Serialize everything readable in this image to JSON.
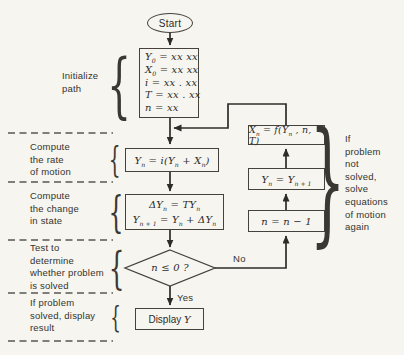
{
  "figure": {
    "kind": "flowchart"
  },
  "terminal": {
    "start": "Start"
  },
  "nodes": {
    "init": {
      "l1": [
        "Y",
        "_0",
        " = xx xx"
      ],
      "l2": [
        "X",
        "_0",
        " = xx xx"
      ],
      "l3": [
        "i = xx . xx"
      ],
      "l4": [
        "T = xx . xx"
      ],
      "l5": [
        "n = xx"
      ]
    },
    "rate": {
      "l1": [
        "Y",
        "_n",
        " = i(Y",
        "_n",
        " + X",
        "_n",
        ")"
      ]
    },
    "change": {
      "l1": [
        "ΔY",
        "_n",
        " = TY",
        "_n"
      ],
      "l2": [
        "Y",
        "_n + 1",
        " = Y",
        "_n",
        " + ΔY",
        "_n"
      ]
    },
    "decision": {
      "l1": [
        "n ≤ 0 ?"
      ]
    },
    "display": {
      "l1": [
        "Display ",
        "*Y"
      ]
    },
    "xn": {
      "l1": [
        "X",
        "_n",
        " = f(Y",
        "_n",
        " , n, T)"
      ]
    },
    "yn": {
      "l1": [
        "Y",
        "_n",
        " = Y",
        "_n + 1"
      ]
    },
    "ndec": {
      "l1": [
        "n = n − 1"
      ]
    }
  },
  "edge_labels": {
    "yes": "Yes",
    "no": "No"
  },
  "annotations": {
    "initialize": "Initialize\npath",
    "rate": "Compute\nthe rate\nof motion",
    "change": "Compute\nthe change\nin state",
    "test": "Test to\ndetermine\nwhether problem\nis solved",
    "result": "If problem\nsolved, display\nresult",
    "loop": "If\nproblem\nnot\nsolved,\nsolve\nequations\nof motion\nagain"
  },
  "icons": {
    "brace_left": "{",
    "brace_right": "}"
  },
  "colors": {
    "ink": "#2e2c28",
    "paper": "#f6f5f0"
  }
}
